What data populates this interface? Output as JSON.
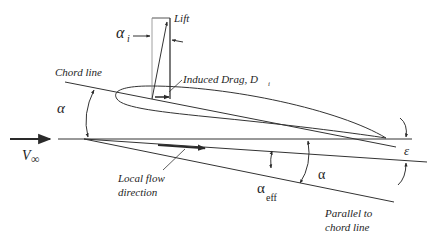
{
  "diagram": {
    "type": "airfoil-induced-drag",
    "labels": {
      "lift": "Lift",
      "alpha_i": "α",
      "alpha_i_sub": "i",
      "chord_line": "Chord line",
      "induced_drag": "Induced Drag, D",
      "induced_drag_sub": "i",
      "alpha": "α",
      "v_inf": "V",
      "v_inf_sub": "∞",
      "local_flow_1": "Local flow",
      "local_flow_2": "direction",
      "alpha_eff": "α",
      "alpha_eff_sub": "eff",
      "alpha_right": "α",
      "epsilon": "ε",
      "parallel_1": "Parallel to",
      "parallel_2": "chord line"
    },
    "colors": {
      "line": "#2a2a2a",
      "text": "#1e1e1e",
      "background": "#ffffff"
    }
  }
}
